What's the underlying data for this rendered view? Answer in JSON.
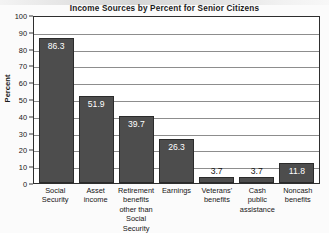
{
  "chart_data": {
    "type": "bar",
    "title": "Income Sources by Percent for Senior Citizens",
    "xlabel": "",
    "ylabel": "Percent",
    "ylim": [
      0,
      100
    ],
    "ytick_step": 10,
    "yticks": [
      100,
      90,
      80,
      70,
      60,
      50,
      40,
      30,
      20,
      10,
      0
    ],
    "grid": true,
    "legend": "none",
    "categories": [
      "Social Security",
      "Asset income",
      "Retirement benefits other than Social Security",
      "Earnings",
      "Veterans' benefits",
      "Cash public assistance",
      "Noncash benefits"
    ],
    "tick_label_lines": [
      [
        "Social",
        "Security"
      ],
      [
        "Asset",
        "income"
      ],
      [
        "Retirement",
        "benefits",
        "other than",
        "Social Security"
      ],
      [
        "Earnings"
      ],
      [
        "Veterans'",
        "benefits"
      ],
      [
        "Cash public",
        "assistance"
      ],
      [
        "Noncash",
        "benefits"
      ]
    ],
    "values": [
      86.3,
      51.9,
      39.7,
      26.3,
      3.7,
      3.7,
      11.8
    ],
    "value_labels": [
      "86.3",
      "51.9",
      "39.7",
      "26.3",
      "3.7",
      "3.7",
      "11.8"
    ],
    "label_position": [
      "inside",
      "inside",
      "inside",
      "inside",
      "outside",
      "outside",
      "inside"
    ],
    "colors": {
      "bar_fill": "#4d4d4d",
      "bar_edge": "#2b2b2b",
      "plot_background": "#ffffff",
      "gridline": "#8d8d8d",
      "axis": "#2e2e2e",
      "text": "#161616",
      "value_text_inside": "#ffffff",
      "page_background": "#fbfbfb"
    }
  }
}
